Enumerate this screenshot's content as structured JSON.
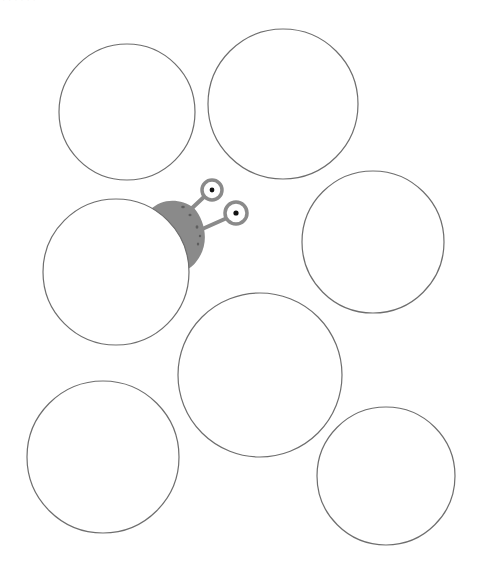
{
  "page": {
    "top_fragment_text": "· · · · · ·",
    "background": "#ffffff",
    "stroke_color": "#6e6e6e"
  },
  "circles": [
    {
      "id": "circle-1",
      "cx": 127,
      "cy": 112,
      "r": 68
    },
    {
      "id": "circle-2",
      "cx": 283,
      "cy": 104,
      "r": 75
    },
    {
      "id": "circle-3",
      "cx": 373,
      "cy": 242,
      "r": 71
    },
    {
      "id": "circle-4",
      "cx": 116,
      "cy": 272,
      "r": 73
    },
    {
      "id": "circle-5",
      "cx": 260,
      "cy": 375,
      "r": 82
    },
    {
      "id": "circle-6",
      "cx": 103,
      "cy": 457,
      "r": 76
    },
    {
      "id": "circle-7",
      "cx": 386,
      "cy": 476,
      "r": 69
    }
  ],
  "snail": {
    "body_color": "#8a8a8a",
    "spot_color": "#5e5e5e",
    "eye_ring_color": "#8a8a8a",
    "pupil_color": "#111111",
    "eyes": [
      {
        "cx": 212,
        "cy": 190,
        "r": 10
      },
      {
        "cx": 236,
        "cy": 213,
        "r": 11
      }
    ]
  }
}
